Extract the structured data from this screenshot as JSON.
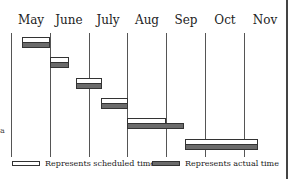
{
  "chart_data": {
    "type": "gantt",
    "title": "",
    "xlabel": "",
    "ylabel": "",
    "categories": [
      "May",
      "June",
      "July",
      "Aug",
      "Sep",
      "Oct",
      "Nov"
    ],
    "grid": true,
    "legend_position": "bottom",
    "units": "month fraction (0 = start of May, 7 = end of Nov)",
    "tasks": [
      {
        "row": 1,
        "scheduled": [
          0.3,
          1.0
        ],
        "actual": [
          0.3,
          1.0
        ]
      },
      {
        "row": 2,
        "scheduled": [
          1.0,
          1.5
        ],
        "actual": [
          1.0,
          1.5
        ]
      },
      {
        "row": 3,
        "scheduled": [
          1.7,
          2.35
        ],
        "actual": [
          1.7,
          2.35
        ]
      },
      {
        "row": 4,
        "scheduled": [
          2.35,
          3.0
        ],
        "actual": [
          2.35,
          3.0
        ]
      },
      {
        "row": 5,
        "scheduled": [
          3.0,
          4.0
        ],
        "actual": [
          3.0,
          4.45
        ]
      },
      {
        "row": 6,
        "scheduled": [
          4.5,
          6.35
        ],
        "actual": [
          4.5,
          6.35
        ]
      }
    ],
    "series": [
      {
        "name": "Represents scheduled time",
        "style": "hollow"
      },
      {
        "name": "Represents actual time",
        "style": "filled"
      }
    ]
  },
  "axis": {
    "months": [
      {
        "label": "May",
        "x": 31
      },
      {
        "label": "June",
        "x": 69
      },
      {
        "label": "July",
        "x": 108
      },
      {
        "label": "Aug",
        "x": 147
      },
      {
        "label": "Sep",
        "x": 186
      },
      {
        "label": "Oct",
        "x": 225
      },
      {
        "label": "Nov",
        "x": 265
      }
    ],
    "gridlines_x": [
      11,
      50,
      89,
      127,
      166,
      205,
      244
    ]
  },
  "bars": [
    {
      "x1": 22,
      "x2": 50,
      "y": 37,
      "type": "scheduled"
    },
    {
      "x1": 22,
      "x2": 50,
      "y": 42,
      "type": "actual"
    },
    {
      "x1": 50,
      "x2": 69,
      "y": 57,
      "type": "scheduled"
    },
    {
      "x1": 50,
      "x2": 69,
      "y": 62,
      "type": "actual"
    },
    {
      "x1": 76,
      "x2": 102,
      "y": 78,
      "type": "scheduled"
    },
    {
      "x1": 76,
      "x2": 102,
      "y": 83,
      "type": "actual"
    },
    {
      "x1": 101,
      "x2": 128,
      "y": 98,
      "type": "scheduled"
    },
    {
      "x1": 101,
      "x2": 128,
      "y": 103,
      "type": "actual"
    },
    {
      "x1": 127,
      "x2": 166,
      "y": 118,
      "type": "scheduled"
    },
    {
      "x1": 127,
      "x2": 184,
      "y": 123,
      "type": "actual"
    },
    {
      "x1": 185,
      "x2": 258,
      "y": 139,
      "type": "scheduled"
    },
    {
      "x1": 185,
      "x2": 258,
      "y": 144,
      "type": "actual"
    }
  ],
  "legend": {
    "scheduled_label": "Represents scheduled time",
    "actual_label": "Represents actual time"
  },
  "edge_glyphs": [
    {
      "text": "a",
      "y": 126
    }
  ]
}
